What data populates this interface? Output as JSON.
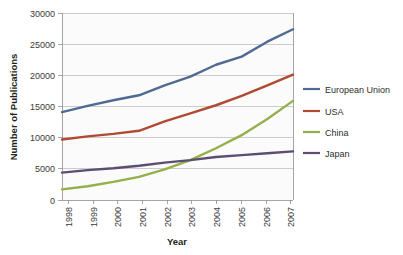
{
  "chart_data": {
    "type": "line",
    "title": "",
    "xlabel": "Year",
    "ylabel": "Number of Publications",
    "x": [
      1998,
      1999,
      2000,
      2001,
      2002,
      2003,
      2004,
      2005,
      2006,
      2007
    ],
    "categories": [
      "1998",
      "1999",
      "2000",
      "2001",
      "2002",
      "2003",
      "2004",
      "2005",
      "2006",
      "2007"
    ],
    "xtick_labels": [
      "1998",
      "1999",
      "2000",
      "2001",
      "2002",
      "2003",
      "2004",
      "2005",
      "2006",
      "2007"
    ],
    "ytick_labels": [
      "0",
      "5000",
      "10000",
      "15000",
      "20000",
      "25000",
      "30000"
    ],
    "yticks": [
      0,
      5000,
      10000,
      15000,
      20000,
      25000,
      30000
    ],
    "ylim": [
      0,
      30000
    ],
    "xlim": [
      1998,
      2007
    ],
    "grid": "horizontal",
    "legend_position": "right",
    "series": [
      {
        "name": "European Union",
        "color": "#4f6b93",
        "values": [
          14100,
          15100,
          16000,
          16800,
          18400,
          19800,
          21700,
          23000,
          25400,
          27400
        ]
      },
      {
        "name": "USA",
        "color": "#b04a32",
        "values": [
          9700,
          10200,
          10600,
          11100,
          12600,
          13900,
          15200,
          16700,
          18400,
          20100
        ]
      },
      {
        "name": "China",
        "color": "#93b04a",
        "values": [
          1700,
          2200,
          2900,
          3700,
          4900,
          6400,
          8300,
          10400,
          13000,
          15900
        ]
      },
      {
        "name": "Japan",
        "color": "#5b4e72",
        "values": [
          4400,
          4800,
          5100,
          5500,
          6000,
          6400,
          6900,
          7200,
          7500,
          7800
        ]
      }
    ]
  },
  "legend": {
    "entries": [
      {
        "label": "European Union",
        "color": "#4f6b93"
      },
      {
        "label": "USA",
        "color": "#b04a32"
      },
      {
        "label": "China",
        "color": "#93b04a"
      },
      {
        "label": "Japan",
        "color": "#5b4e72"
      }
    ]
  },
  "axes": {
    "x_title": "Year",
    "y_title": "Number of Publications"
  }
}
